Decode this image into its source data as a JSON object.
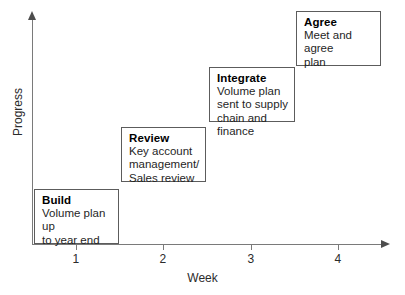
{
  "chart_data": {
    "type": "diagram",
    "title": "",
    "xlabel": "Week",
    "ylabel": "Progress",
    "xticks": [
      "1",
      "2",
      "3",
      "4"
    ],
    "xtick_positions": [
      76,
      163,
      251,
      338
    ],
    "grid": false,
    "legend": "none",
    "steps": [
      {
        "title": "Build",
        "desc": "Volume plan up\nto year end",
        "week": 1,
        "box": {
          "left": 34,
          "top": 189,
          "width": 85,
          "height": 55
        }
      },
      {
        "title": "Review",
        "desc": "Key account\nmanagement/\nSales review",
        "week": 2,
        "box": {
          "left": 121,
          "top": 127,
          "width": 85,
          "height": 55
        }
      },
      {
        "title": "Integrate",
        "desc": "Volume plan\nsent to supply\nchain and finance",
        "week": 3,
        "box": {
          "left": 209,
          "top": 67,
          "width": 86,
          "height": 55
        }
      },
      {
        "title": "Agree",
        "desc": "Meet and agree\nplan",
        "week": 4,
        "box": {
          "left": 296,
          "top": 11,
          "width": 85,
          "height": 55
        }
      }
    ]
  },
  "axes": {
    "x_title": "Week",
    "y_title": "Progress",
    "tick_labels": [
      "1",
      "2",
      "3",
      "4"
    ]
  },
  "colors": {
    "axis": "#7a7a7a",
    "arrow": "#4d4d4d",
    "box_border": "#5c5c5c",
    "text": "#1f1f1f",
    "background": "#ffffff"
  }
}
